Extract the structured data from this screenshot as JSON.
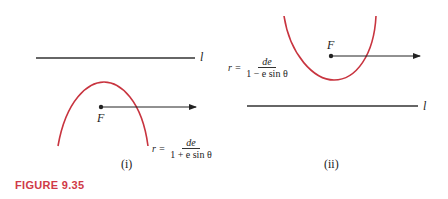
{
  "figure": {
    "label": "FIGURE 9.35",
    "accent_color": "#c8343f"
  },
  "panels": [
    {
      "caption": "(i)",
      "line_label": "l",
      "focus_label": "F",
      "equation": {
        "lhs": "r =",
        "numerator": "de",
        "denominator": "1 + e sin θ"
      }
    },
    {
      "caption": "(ii)",
      "line_label": "l",
      "focus_label": "F",
      "equation": {
        "lhs": "r =",
        "numerator": "de",
        "denominator": "1 − e sin θ"
      }
    }
  ]
}
